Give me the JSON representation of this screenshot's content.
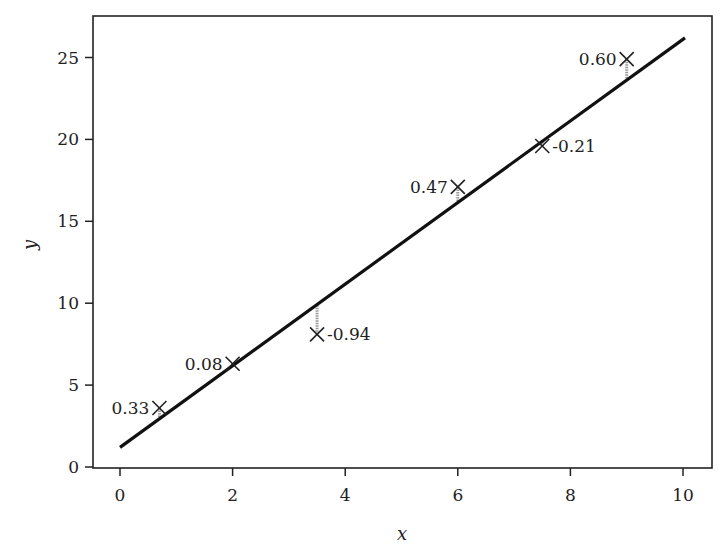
{
  "chart_data": {
    "type": "scatter",
    "title": "",
    "xlabel": "x",
    "ylabel": "y",
    "xlim": [
      -0.5,
      10.5
    ],
    "ylim": [
      0,
      27.5
    ],
    "grid": false,
    "legend": null,
    "xticks": [
      0,
      2,
      4,
      6,
      8,
      10
    ],
    "yticks": [
      0,
      5,
      10,
      15,
      20,
      25
    ],
    "xtick_labels": [
      "0",
      "2",
      "4",
      "6",
      "8",
      "10"
    ],
    "ytick_labels": [
      "0",
      "5",
      "10",
      "15",
      "20",
      "25"
    ],
    "series": [
      {
        "name": "observations",
        "marker": "x",
        "x": [
          0.7,
          2.0,
          3.5,
          6.0,
          7.5,
          9.0
        ],
        "y": [
          3.6,
          6.3,
          8.1,
          17.1,
          19.6,
          24.9
        ]
      },
      {
        "name": "fitted line",
        "type": "line",
        "x": [
          0,
          10
        ],
        "y": [
          1.2,
          26.2
        ]
      }
    ],
    "residuals": [
      {
        "x": 0.7,
        "label": "0.33",
        "position": "left"
      },
      {
        "x": 2.0,
        "label": "0.08",
        "position": "left"
      },
      {
        "x": 3.5,
        "label": "-0.94",
        "position": "right"
      },
      {
        "x": 6.0,
        "label": "0.47",
        "position": "left"
      },
      {
        "x": 7.5,
        "label": "-0.21",
        "position": "right"
      },
      {
        "x": 9.0,
        "label": "0.60",
        "position": "left"
      }
    ],
    "annotations": [
      "0.33",
      "0.08",
      "-0.94",
      "0.47",
      "-0.21",
      "0.60"
    ]
  },
  "colors": {
    "line": "#111111",
    "marker": "#222222",
    "residual": "#9a9a9a",
    "axes": "#222222"
  }
}
